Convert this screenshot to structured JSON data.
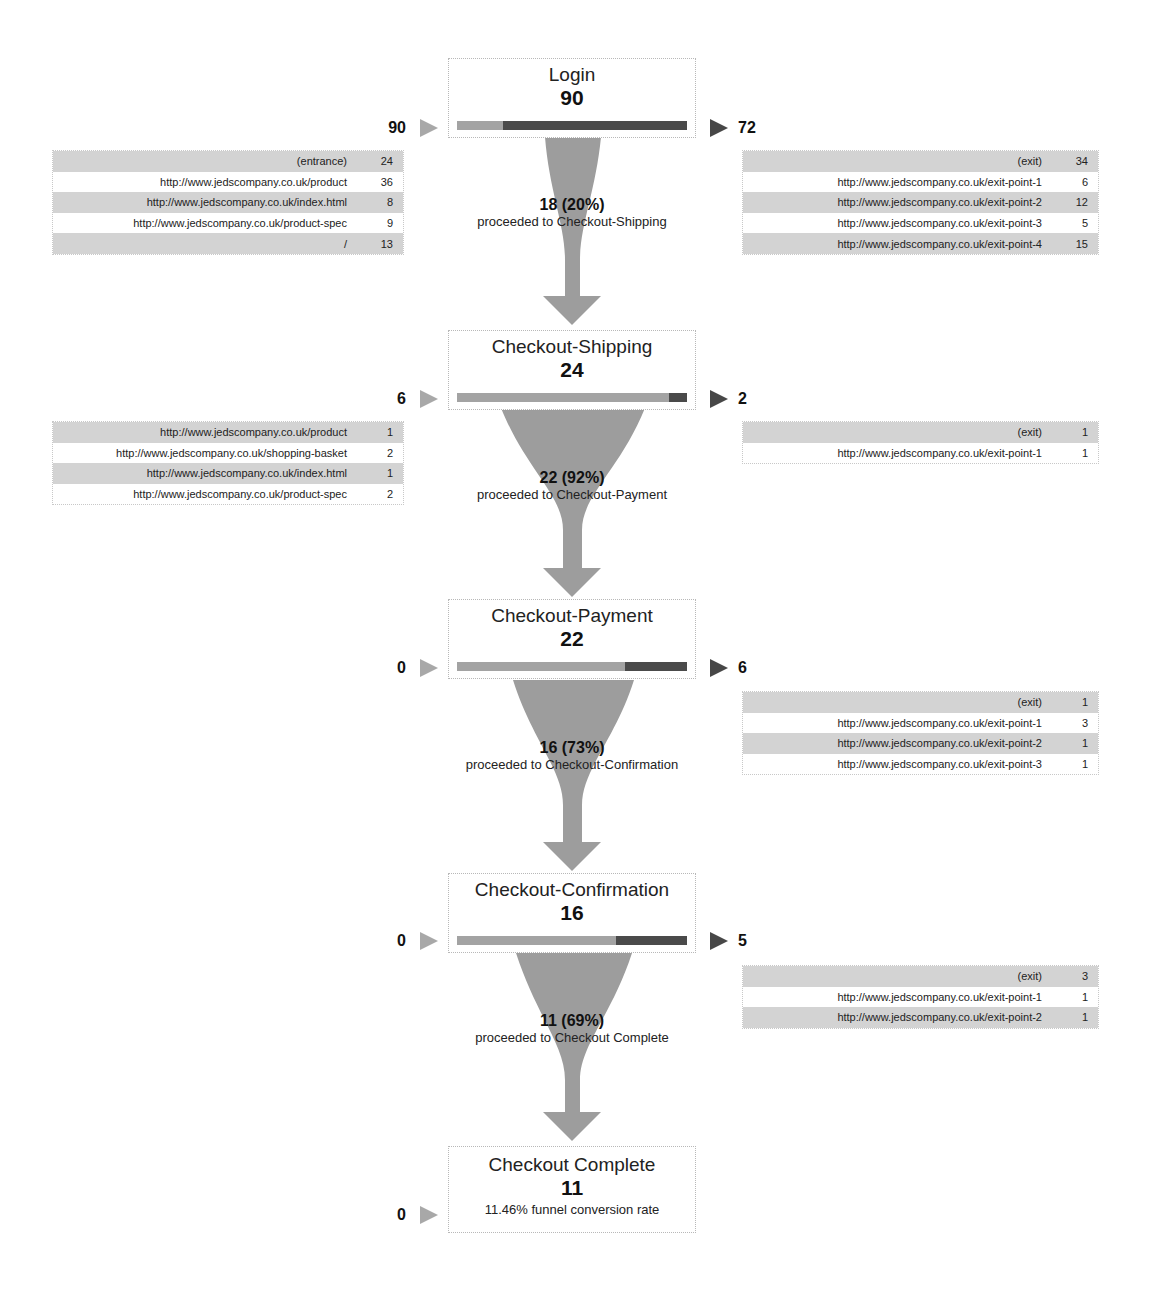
{
  "funnel": {
    "steps": [
      {
        "name": "Login",
        "count": "90",
        "in_count": "90",
        "out_count": "72",
        "continue_ratio": 0.2,
        "entrances": [
          {
            "url": "(entrance)",
            "value": "24"
          },
          {
            "url": "http://www.jedscompany.co.uk/product",
            "value": "36"
          },
          {
            "url": "http://www.jedscompany.co.uk/index.html",
            "value": "8"
          },
          {
            "url": "http://www.jedscompany.co.uk/product-spec",
            "value": "9"
          },
          {
            "url": "/",
            "value": "13"
          }
        ],
        "exits": [
          {
            "url": "(exit)",
            "value": "34"
          },
          {
            "url": "http://www.jedscompany.co.uk/exit-point-1",
            "value": "6"
          },
          {
            "url": "http://www.jedscompany.co.uk/exit-point-2",
            "value": "12"
          },
          {
            "url": "http://www.jedscompany.co.uk/exit-point-3",
            "value": "5"
          },
          {
            "url": "http://www.jedscompany.co.uk/exit-point-4",
            "value": "15"
          }
        ],
        "flow": {
          "count": "18 (20%)",
          "label": "proceeded to Checkout-Shipping"
        }
      },
      {
        "name": "Checkout-Shipping",
        "count": "24",
        "in_count": "6",
        "out_count": "2",
        "continue_ratio": 0.92,
        "entrances": [
          {
            "url": "http://www.jedscompany.co.uk/product",
            "value": "1"
          },
          {
            "url": "http://www.jedscompany.co.uk/shopping-basket",
            "value": "2"
          },
          {
            "url": "http://www.jedscompany.co.uk/index.html",
            "value": "1"
          },
          {
            "url": "http://www.jedscompany.co.uk/product-spec",
            "value": "2"
          }
        ],
        "exits": [
          {
            "url": "(exit)",
            "value": "1"
          },
          {
            "url": "http://www.jedscompany.co.uk/exit-point-1",
            "value": "1"
          }
        ],
        "flow": {
          "count": "22 (92%)",
          "label": "proceeded to Checkout-Payment"
        }
      },
      {
        "name": "Checkout-Payment",
        "count": "22",
        "in_count": "0",
        "out_count": "6",
        "continue_ratio": 0.73,
        "entrances": [],
        "exits": [
          {
            "url": "(exit)",
            "value": "1"
          },
          {
            "url": "http://www.jedscompany.co.uk/exit-point-1",
            "value": "3"
          },
          {
            "url": "http://www.jedscompany.co.uk/exit-point-2",
            "value": "1"
          },
          {
            "url": "http://www.jedscompany.co.uk/exit-point-3",
            "value": "1"
          }
        ],
        "flow": {
          "count": "16 (73%)",
          "label": "proceeded to Checkout-Confirmation"
        }
      },
      {
        "name": "Checkout-Confirmation",
        "count": "16",
        "in_count": "0",
        "out_count": "5",
        "continue_ratio": 0.69,
        "entrances": [],
        "exits": [
          {
            "url": "(exit)",
            "value": "3"
          },
          {
            "url": "http://www.jedscompany.co.uk/exit-point-1",
            "value": "1"
          },
          {
            "url": "http://www.jedscompany.co.uk/exit-point-2",
            "value": "1"
          }
        ],
        "flow": {
          "count": "11 (69%)",
          "label": "proceeded to Checkout Complete"
        }
      },
      {
        "name": "Checkout Complete",
        "count": "11",
        "in_count": "0",
        "conversion_rate": "11.46% funnel conversion rate"
      }
    ]
  },
  "colors": {
    "continue_bar": "#a3a3a3",
    "exit_bar": "#4a4a4a",
    "funnel_fill": "#9d9d9d",
    "row_shade": "#d3d3d3"
  }
}
